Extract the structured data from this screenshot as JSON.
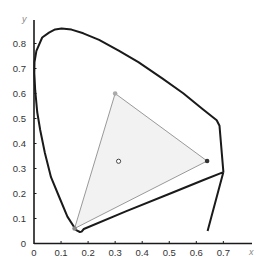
{
  "chart_data": {
    "type": "diagram",
    "xlabel": "x",
    "ylabel": "y",
    "xlim": [
      0,
      0.8
    ],
    "ylim": [
      0,
      0.9
    ],
    "x_ticks": [
      "0",
      "0.1",
      "0.2",
      "0.3",
      "0.4",
      "0.5",
      "0.6",
      "0.7"
    ],
    "y_ticks": [
      "0",
      "0.1",
      "0.2",
      "0.3",
      "0.4",
      "0.5",
      "0.6",
      "0.7",
      "0.8"
    ],
    "spectral_locus_color": "#1a1a1a",
    "gamut_triangle": {
      "fill": "#f2f2f2",
      "stroke": "#999999",
      "vertices": [
        {
          "name": "green",
          "x": 0.3,
          "y": 0.6,
          "marker_color": "#aaaaaa"
        },
        {
          "name": "red",
          "x": 0.64,
          "y": 0.33,
          "marker_color": "#333333"
        },
        {
          "name": "blue",
          "x": 0.15,
          "y": 0.06,
          "marker_color": "#888888"
        }
      ]
    },
    "white_point": {
      "name": "D65",
      "x": 0.3127,
      "y": 0.329,
      "marker": "hollow-circle"
    }
  }
}
